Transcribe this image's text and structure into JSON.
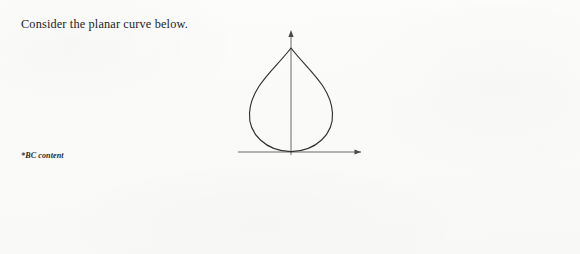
{
  "page": {
    "background_color": "#fbfbfa",
    "prompt_text": "Consider the planar curve below.",
    "footnote": "*BC content"
  },
  "figure": {
    "name": "planar-curve-cardioid",
    "axis_color": "#555555",
    "curve_color": "#2b2b2b",
    "x_axis": {
      "label": "",
      "arrow": "right"
    },
    "y_axis": {
      "label": "",
      "arrow": "up"
    }
  },
  "nav": {
    "connector_color": "#a8a8a8",
    "node_fill": "#c8c8c8",
    "node_border": "#5e5e5e",
    "active_border": "#141414",
    "items": [
      {
        "id": "parametric",
        "label_line1": "Parametric",
        "label_line2": "Functions",
        "active": true
      },
      {
        "id": "polar",
        "label_line1": "Polar Functions",
        "label_line2": "",
        "active": false
      },
      {
        "id": "vector",
        "label_line1": "Vector",
        "label_line2": "Functions",
        "active": false
      },
      {
        "id": "review",
        "label_line1": "Review",
        "label_line2": "Questions",
        "active": false
      },
      {
        "id": "answers",
        "label_line1": "Answers &",
        "label_line2": "Explanations",
        "active": false
      }
    ]
  }
}
